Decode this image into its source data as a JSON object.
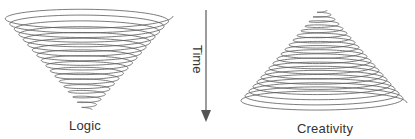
{
  "diagram": {
    "left": {
      "label": "Logic",
      "shape": "inverted-cone-spiral"
    },
    "arrow": {
      "label": "Time",
      "direction": "down"
    },
    "right": {
      "label": "Creativity",
      "shape": "upright-cone-spiral"
    },
    "colors": {
      "stroke": "#555555",
      "arrow": "#666666",
      "text": "#333333"
    }
  }
}
